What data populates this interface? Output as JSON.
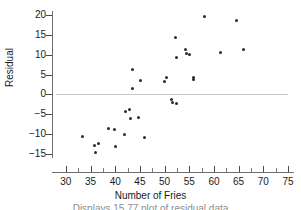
{
  "chart_data": {
    "type": "scatter",
    "title": "",
    "xlabel": "Number of Fries",
    "ylabel": "Residual",
    "xlim": [
      28,
      75
    ],
    "ylim": [
      -16,
      21
    ],
    "grid": false,
    "legend": null,
    "reference_line": {
      "type": "horizontal",
      "y": 0,
      "color": "#c9c9c9"
    },
    "x_ticks": [
      30,
      35,
      40,
      45,
      50,
      55,
      60,
      65,
      70,
      75
    ],
    "y_ticks": [
      -15,
      -10,
      -5,
      0,
      5,
      10,
      15,
      20
    ],
    "x_tick_labels": [
      "30",
      "35",
      "40",
      "45",
      "50",
      "55",
      "60",
      "65",
      "70",
      "75"
    ],
    "y_tick_labels": [
      "−15",
      "−10",
      "−5",
      "0",
      "5",
      "10",
      "15",
      "20"
    ],
    "point_color": "#2b2b2b",
    "points": [
      {
        "x": 33.4,
        "y": -10.6
      },
      {
        "x": 35.8,
        "y": -12.9
      },
      {
        "x": 36.0,
        "y": -14.7
      },
      {
        "x": 36.6,
        "y": -12.4
      },
      {
        "x": 38.7,
        "y": -8.7
      },
      {
        "x": 39.9,
        "y": -8.8
      },
      {
        "x": 40.1,
        "y": -13.2
      },
      {
        "x": 41.8,
        "y": -10.2
      },
      {
        "x": 42.1,
        "y": -4.2
      },
      {
        "x": 42.9,
        "y": -3.9
      },
      {
        "x": 43.0,
        "y": -6.0
      },
      {
        "x": 43.4,
        "y": 6.3
      },
      {
        "x": 43.5,
        "y": 1.4
      },
      {
        "x": 44.8,
        "y": -5.7
      },
      {
        "x": 45.1,
        "y": 3.4
      },
      {
        "x": 46.0,
        "y": -10.8
      },
      {
        "x": 50.0,
        "y": 3.2
      },
      {
        "x": 50.4,
        "y": 4.3
      },
      {
        "x": 51.3,
        "y": -1.3
      },
      {
        "x": 51.5,
        "y": -2.1
      },
      {
        "x": 52.3,
        "y": 14.3
      },
      {
        "x": 52.4,
        "y": 9.4
      },
      {
        "x": 52.5,
        "y": -2.2
      },
      {
        "x": 54.3,
        "y": 11.2
      },
      {
        "x": 54.4,
        "y": 10.3
      },
      {
        "x": 55.0,
        "y": 10.0
      },
      {
        "x": 55.8,
        "y": 4.3
      },
      {
        "x": 55.9,
        "y": 3.8
      },
      {
        "x": 58.0,
        "y": 19.5
      },
      {
        "x": 61.3,
        "y": 10.6
      },
      {
        "x": 64.5,
        "y": 18.6
      },
      {
        "x": 66.0,
        "y": 11.2
      }
    ]
  },
  "caption": "Displays 15.77   plot of residual data"
}
